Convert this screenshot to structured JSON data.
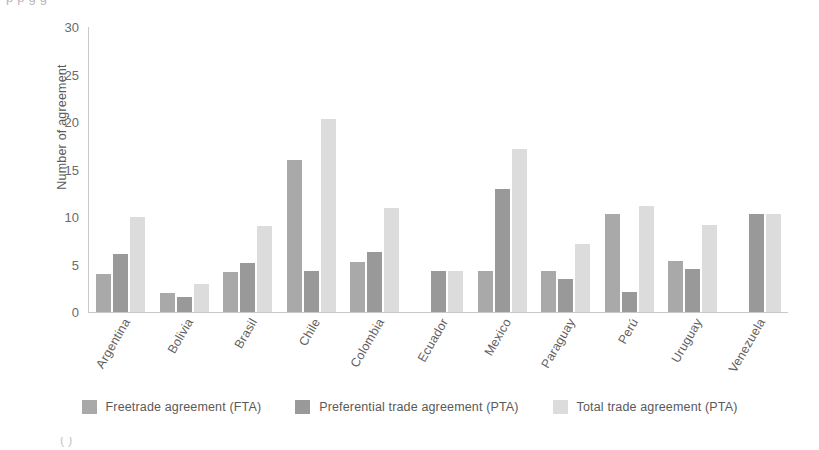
{
  "figure": {
    "top_cropped_text": "p p g g",
    "bottom_cropped_text": "( )"
  },
  "chart_data": {
    "type": "bar",
    "title": "",
    "xlabel": "",
    "ylabel": "Number of agreement",
    "ylim": [
      0,
      30
    ],
    "yticks": [
      0,
      5,
      10,
      15,
      20,
      25,
      30
    ],
    "grid": false,
    "legend_position": "bottom",
    "categories": [
      "Argentina",
      "Bolivia",
      "Brasil",
      "Chile",
      "Colombia",
      "Ecuador",
      "Mexico",
      "Paraguay",
      "Perú",
      "Uruguay",
      "Venezuela"
    ],
    "series": [
      {
        "name": "Freetrade agreement (FTA)",
        "color": "#a9a9a9",
        "values": [
          4,
          2,
          4.2,
          16,
          5.3,
          0,
          4.3,
          4.3,
          10.3,
          5.4,
          0
        ]
      },
      {
        "name": "Preferential trade agreement (PTA)",
        "color": "#999999",
        "values": [
          6.1,
          1.6,
          5.2,
          4.3,
          6.3,
          4.3,
          13,
          3.5,
          2.1,
          4.5,
          10.3
        ]
      },
      {
        "name": "Total trade agreement (PTA)",
        "color": "#dcdcdc",
        "values": [
          10,
          3,
          9.1,
          20.3,
          11,
          4.3,
          17.2,
          7.2,
          11.2,
          9.2,
          10.3
        ]
      }
    ]
  }
}
